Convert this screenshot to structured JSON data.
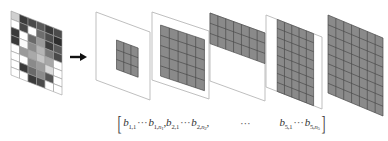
{
  "diagram": {
    "input_image": {
      "cols": 6,
      "rows": 8,
      "cell_shades": [
        [
          "#d0d0d0",
          "#3c3c3c",
          "#4a4a4a",
          "#5a5a5a",
          "#3a3a3a",
          "#4b4b4b"
        ],
        [
          "#ffffff",
          "#484848",
          "#ffffff",
          "#6e6e6e",
          "#4e4e4e",
          "#2e2e2e"
        ],
        [
          "#3a3a3a",
          "#ffffff",
          "#6a6a6a",
          "#9a9a9a",
          "#3e3e3e",
          "#5a5a5a"
        ],
        [
          "#3a3a3a",
          "#fafafa",
          "#8c8c8c",
          "#b5b5b5",
          "#7a7a7a",
          "#4a4a4a"
        ],
        [
          "#ffffff",
          "#9a9a9a",
          "#a9a9a9",
          "#c5c5c5",
          "#a8a8a8",
          "#ffffff"
        ],
        [
          "#ffffff",
          "#ffffff",
          "#8a8a8a",
          "#9c9c9c",
          "#d9d9d9",
          "#ffffff"
        ],
        [
          "#ffffff",
          "#3a3a3a",
          "#6a6a6a",
          "#8a8a8a",
          "#555555",
          "#ffffff"
        ],
        [
          "#ffffff",
          "#ffffff",
          "#3a3a3a",
          "#4a4a4a",
          "#ffffff",
          "#ffffff"
        ]
      ]
    },
    "arrow": "right-arrow",
    "panels": [
      {
        "id": "level-1",
        "grid_cols": 3,
        "grid_rows": 3,
        "region": "center"
      },
      {
        "id": "level-2",
        "grid_cols": 5,
        "grid_rows": 5,
        "region": "inset"
      },
      {
        "id": "level-3",
        "grid_cols": 7,
        "grid_rows": 3,
        "region": "top"
      },
      {
        "id": "level-4",
        "grid_cols": 5,
        "grid_rows": 8,
        "region": "vertical-strip"
      },
      {
        "id": "level-5",
        "grid_cols": 7,
        "grid_rows": 8,
        "region": "full"
      }
    ],
    "colors": {
      "grid_fill": "#8a8a8a",
      "grid_line": "#4a4a4a",
      "frame": "#b8b8b8",
      "arrow": "#111111"
    }
  },
  "formula": {
    "open_bracket": "[",
    "close_bracket": "]",
    "terms": [
      {
        "var": "b",
        "start": "1,1",
        "end_prefix": "1,",
        "end_n": "n",
        "end_sub": "1"
      },
      {
        "var": "b",
        "start": "2,1",
        "end_prefix": "2,",
        "end_n": "n",
        "end_sub": "2"
      },
      {
        "var": "b",
        "start": "5,1",
        "end_prefix": "5,",
        "end_n": "n",
        "end_sub": "5"
      }
    ],
    "inner_dots": "···",
    "middle_ellipsis": "···",
    "separator": ","
  }
}
